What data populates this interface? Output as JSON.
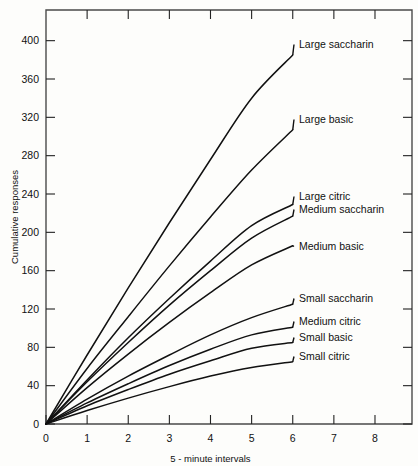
{
  "chart_data": {
    "type": "line",
    "title": "",
    "xlabel": "5 - minute intervals",
    "ylabel": "Cumulative responses",
    "xlim": [
      0,
      8.9
    ],
    "ylim": [
      0,
      432
    ],
    "xticks": [
      0,
      1,
      2,
      3,
      4,
      5,
      6,
      7,
      8
    ],
    "yticks": [
      0,
      40,
      80,
      120,
      160,
      200,
      240,
      280,
      320,
      360,
      400
    ],
    "grid": false,
    "legend": "inline-right-of-curve-ends",
    "x": [
      0,
      1,
      2,
      3,
      4,
      5,
      6
    ],
    "series": [
      {
        "name": "Large saccharin",
        "label": "Large saccharin",
        "values": [
          0,
          72,
          142,
          210,
          276,
          340,
          385
        ]
      },
      {
        "name": "Large basic",
        "label": "Large basic",
        "values": [
          0,
          58,
          112,
          165,
          216,
          265,
          307
        ]
      },
      {
        "name": "Large citric",
        "label": "Large citric",
        "values": [
          0,
          46,
          90,
          131,
          170,
          207,
          229
        ]
      },
      {
        "name": "Medium saccharin",
        "label": "Medium saccharin",
        "values": [
          0,
          44,
          85,
          124,
          160,
          194,
          217
        ]
      },
      {
        "name": "Medium basic",
        "label": "Medium basic",
        "values": [
          0,
          38,
          73,
          106,
          137,
          166,
          186
        ]
      },
      {
        "name": "Small saccharin",
        "label": "Small saccharin",
        "values": [
          0,
          26,
          50,
          72,
          93,
          111,
          125
        ]
      },
      {
        "name": "Medium citric",
        "label": "Medium citric",
        "values": [
          0,
          22,
          42,
          61,
          78,
          93,
          101
        ]
      },
      {
        "name": "Small basic",
        "label": "Small basic",
        "values": [
          0,
          19,
          36,
          52,
          66,
          79,
          85
        ]
      },
      {
        "name": "Small citric",
        "label": "Small citric",
        "values": [
          0,
          14,
          27,
          39,
          50,
          59,
          65
        ]
      }
    ]
  },
  "axes": {
    "y_title": "Cumulative responses",
    "x_title": "5 - minute intervals",
    "y_tick_labels": [
      "0",
      "40",
      "80",
      "120",
      "160",
      "200",
      "240",
      "280",
      "320",
      "360",
      "400"
    ],
    "x_tick_labels": [
      "0",
      "1",
      "2",
      "3",
      "4",
      "5",
      "6",
      "7",
      "8"
    ]
  },
  "style": {
    "curve_color": "#111111",
    "frame_color": "#4a4a4a",
    "background": "#fdfdfb"
  }
}
